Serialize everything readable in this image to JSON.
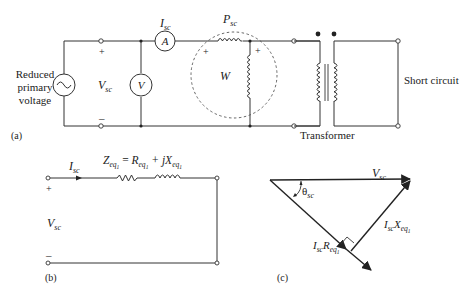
{
  "figure": {
    "panel_a": {
      "label": "(a)",
      "source_label_lines": [
        "Reduced",
        "primary",
        "voltage"
      ],
      "source_icon": "ac-source-icon",
      "voltage_label_main": "V",
      "voltage_label_sub": "sc",
      "plus": "+",
      "minus": "–",
      "ammeter_letter": "A",
      "ammeter_current_main": "I",
      "ammeter_current_sub": "sc",
      "voltmeter_letter": "V",
      "wattmeter_letter": "W",
      "wattmeter_power_main": "P",
      "wattmeter_power_sub": "sc",
      "transformer_label": "Transformer",
      "short_circuit_label": "Short circuit"
    },
    "panel_b": {
      "label": "(b)",
      "current_main": "I",
      "current_sub": "sc",
      "voltage_main": "V",
      "voltage_sub": "sc",
      "plus": "+",
      "minus": "–",
      "impedance_eq": {
        "Z": "Z",
        "eq": "eq",
        "one": "1",
        "equals": " = ",
        "R": "R",
        "plus_j": " + j",
        "X": "X"
      }
    },
    "panel_c": {
      "label": "(c)",
      "v_main": "V",
      "v_sub": "sc",
      "theta_main": "θ",
      "theta_sub": "sc",
      "ir_I": "I",
      "ir_sc": "sc",
      "ir_R": "R",
      "ir_eq": "eq",
      "ir_one": "1",
      "ix_I": "I",
      "ix_sc": "sc",
      "ix_X": "X",
      "ix_eq": "eq",
      "ix_one": "1"
    }
  }
}
